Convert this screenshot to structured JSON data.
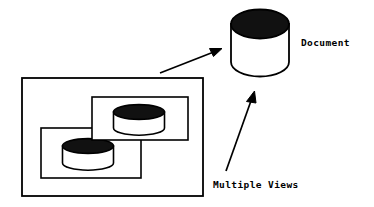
{
  "figure": {
    "kind": "concept-diagram",
    "background_color": "#ffffff",
    "stroke_color": "#000000",
    "fill_dark": "#111111",
    "fill_light": "#ffffff",
    "width": 374,
    "height": 207
  },
  "labels": {
    "document": "Document",
    "multiple_views": "Multiple Views"
  },
  "nodes": [
    {
      "id": "document-cylinder",
      "name": "document-database-cylinder",
      "shape": "cylinder",
      "x": 230,
      "y": 10,
      "width": 60,
      "height": 68,
      "top_fill": "#111111",
      "body_fill": "#ffffff"
    },
    {
      "id": "view-window-outer",
      "name": "views-container-rectangle",
      "shape": "rectangle",
      "x": 22,
      "y": 78,
      "width": 181,
      "height": 118,
      "fill": "#ffffff"
    },
    {
      "id": "view-window-back",
      "name": "view-window-lower-left",
      "shape": "rectangle",
      "x": 41,
      "y": 128,
      "width": 100,
      "height": 50,
      "fill": "#ffffff"
    },
    {
      "id": "view-window-front",
      "name": "view-window-upper-right",
      "shape": "rectangle",
      "x": 92,
      "y": 97,
      "width": 96,
      "height": 43,
      "fill": "#ffffff"
    },
    {
      "id": "view-cylinder-back",
      "name": "view-database-cylinder-lower",
      "shape": "cylinder",
      "x": 62,
      "y": 139,
      "width": 51,
      "height": 31,
      "top_fill": "#111111",
      "body_fill": "#ffffff"
    },
    {
      "id": "view-cylinder-front",
      "name": "view-database-cylinder-upper",
      "shape": "cylinder",
      "x": 113,
      "y": 104,
      "width": 52,
      "height": 32,
      "top_fill": "#111111",
      "body_fill": "#ffffff"
    }
  ],
  "arrows": [
    {
      "id": "arrow-views-to-document",
      "name": "arrow-views-to-document",
      "from_x": 160,
      "from_y": 73,
      "to_x": 221,
      "to_y": 49
    },
    {
      "id": "arrow-label-to-document",
      "name": "arrow-multiple-views-to-document",
      "from_x": 226,
      "from_y": 171,
      "to_x": 254,
      "to_y": 92
    }
  ],
  "text_positions": {
    "document": {
      "x": 301,
      "y": 46
    },
    "multiple_views": {
      "x": 213,
      "y": 188
    }
  }
}
